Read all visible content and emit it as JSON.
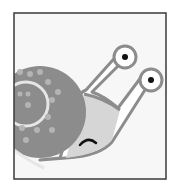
{
  "illustration": {
    "subject": "snail",
    "colors": {
      "background": "#ffffff",
      "frame_fill": "#f7f7f7",
      "frame_border": "#3a3a3a",
      "shell": "#8c8c8c",
      "shell_dots": "#b4b4b4",
      "spiral": "#e6e6e6",
      "body": "#d6d6d6",
      "outline": "#8c8c8c",
      "eye_white": "#ffffff",
      "pupil": "#111111",
      "mouth": "#111111"
    }
  }
}
